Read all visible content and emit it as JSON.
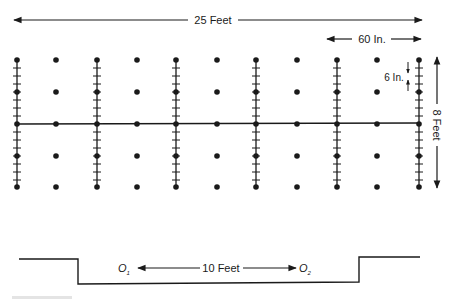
{
  "diagram": {
    "dimensions": {
      "overall_width": "25 Feet",
      "column_spacing": "60 In.",
      "tick_spacing": "6 In.",
      "overall_height": "8 Feet",
      "profile_span": "10 Feet"
    },
    "profile": {
      "left_point": "O",
      "left_sub": "1",
      "right_point": "O",
      "right_sub": "2"
    },
    "colors": {
      "ink": "#1a1a1a",
      "background": "#ffffff"
    }
  }
}
